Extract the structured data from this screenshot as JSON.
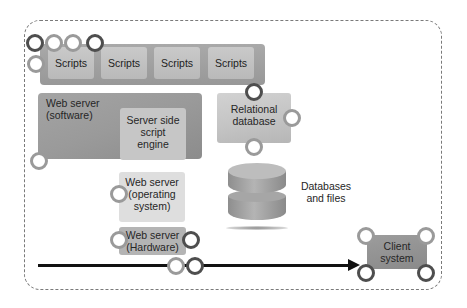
{
  "diagram": {
    "scripts": {
      "tiles": [
        {
          "label": "Scripts"
        },
        {
          "label": "Scripts"
        },
        {
          "label": "Scripts"
        },
        {
          "label": "Scripts"
        }
      ]
    },
    "web_server_software": {
      "label_line1": "Web server",
      "label_line2": "(software)"
    },
    "script_engine": {
      "label_line1": "Server side",
      "label_line2": "script",
      "label_line3": "engine"
    },
    "relational_db": {
      "label_line1": "Relational",
      "label_line2": "database"
    },
    "databases_files": {
      "label_line1": "Databases",
      "label_line2": "and files"
    },
    "web_server_os": {
      "label_line1": "Web server",
      "label_line2": "(operating",
      "label_line3": "system)"
    },
    "web_server_hw": {
      "label_line1": "Web server",
      "label_line2": "(Hardware)"
    },
    "client": {
      "label_line1": "Client",
      "label_line2": "system"
    },
    "colors": {
      "dark_ring": "#4e4e4e",
      "light_ring": "#9a9a9a",
      "arrow": "#111111",
      "frame_border": "#7a7a7a"
    }
  }
}
